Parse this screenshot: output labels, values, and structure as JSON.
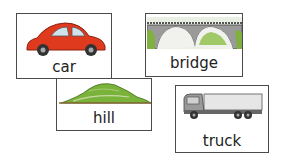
{
  "cards": [
    {
      "word": "car",
      "icon": "car-icon",
      "color": "#e03a1e"
    },
    {
      "word": "bridge",
      "icon": "bridge-icon",
      "color": "#8a8a8a"
    },
    {
      "word": "hill",
      "icon": "hill-icon",
      "color": "#7ab33a"
    },
    {
      "word": "truck",
      "icon": "truck-icon",
      "color": "#9a9a9a"
    }
  ]
}
